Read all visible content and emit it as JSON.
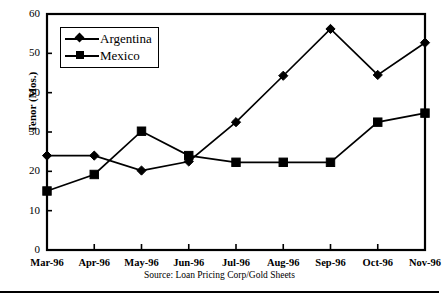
{
  "chart_data": {
    "type": "line",
    "title": "",
    "xlabel": "",
    "ylabel": "Tenor (Mos.)",
    "categories": [
      "Mar-96",
      "Apr-96",
      "May-96",
      "Jun-96",
      "Jul-96",
      "Aug-96",
      "Sep-96",
      "Oct-96",
      "Nov-96"
    ],
    "series": [
      {
        "name": "Argentina",
        "marker": "diamond",
        "values": [
          24.0,
          24.0,
          20.2,
          22.5,
          32.5,
          44.3,
          56.2,
          44.5,
          52.7
        ]
      },
      {
        "name": "Mexico",
        "marker": "square",
        "values": [
          15.0,
          19.2,
          30.2,
          24.0,
          22.3,
          22.3,
          22.3,
          32.5,
          34.8
        ]
      }
    ],
    "ylim": [
      0,
      60
    ],
    "yticks": [
      0,
      10,
      20,
      30,
      40,
      50,
      60
    ],
    "ytick_labels": [
      "0",
      "10",
      "20",
      "30",
      "40",
      "50",
      "60"
    ],
    "grid": false,
    "legend_position": "upper-left",
    "line_color": "#000000",
    "marker_color": "#000000",
    "background_color": "#ffffff"
  },
  "legend": {
    "items": [
      {
        "label": "Argentina",
        "marker": "diamond"
      },
      {
        "label": "Mexico",
        "marker": "square"
      }
    ]
  },
  "footer": {
    "source": "Source: Loan Pricing Corp/Gold Sheets"
  }
}
